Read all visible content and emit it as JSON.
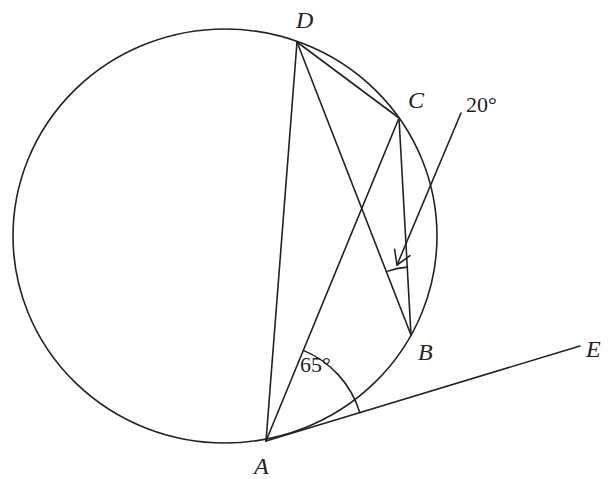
{
  "diagram": {
    "type": "circle-geometry",
    "circle": {
      "cx": 225,
      "cy": 236,
      "rx": 212,
      "ry": 207
    },
    "points": {
      "A": {
        "x": 266,
        "y": 441,
        "label": "A",
        "label_x": 254,
        "label_y": 474
      },
      "B": {
        "x": 411,
        "y": 335,
        "label": "B",
        "label_x": 418,
        "label_y": 360
      },
      "C": {
        "x": 399,
        "y": 118,
        "label": "C",
        "label_x": 408,
        "label_y": 108
      },
      "D": {
        "x": 297,
        "y": 42,
        "label": "D",
        "label_x": 296,
        "label_y": 28
      },
      "E": {
        "x": 580,
        "y": 346,
        "label": "E",
        "label_x": 586,
        "label_y": 357
      }
    },
    "segments": [
      [
        "A",
        "D"
      ],
      [
        "A",
        "C"
      ],
      [
        "D",
        "C"
      ],
      [
        "D",
        "B"
      ],
      [
        "C",
        "B"
      ],
      [
        "A",
        "E"
      ]
    ],
    "angles": [
      {
        "value": "65°",
        "vertex": "A",
        "between": [
          "C",
          "E"
        ],
        "text_x": 300,
        "text_y": 372
      },
      {
        "value": "20°",
        "vertex": "B",
        "between": [
          "D",
          "C"
        ],
        "text_x": 466,
        "text_y": 112
      }
    ],
    "annotation_arrow": {
      "from": {
        "x": 461,
        "y": 113
      },
      "to": {
        "x": 397,
        "y": 265
      }
    }
  }
}
